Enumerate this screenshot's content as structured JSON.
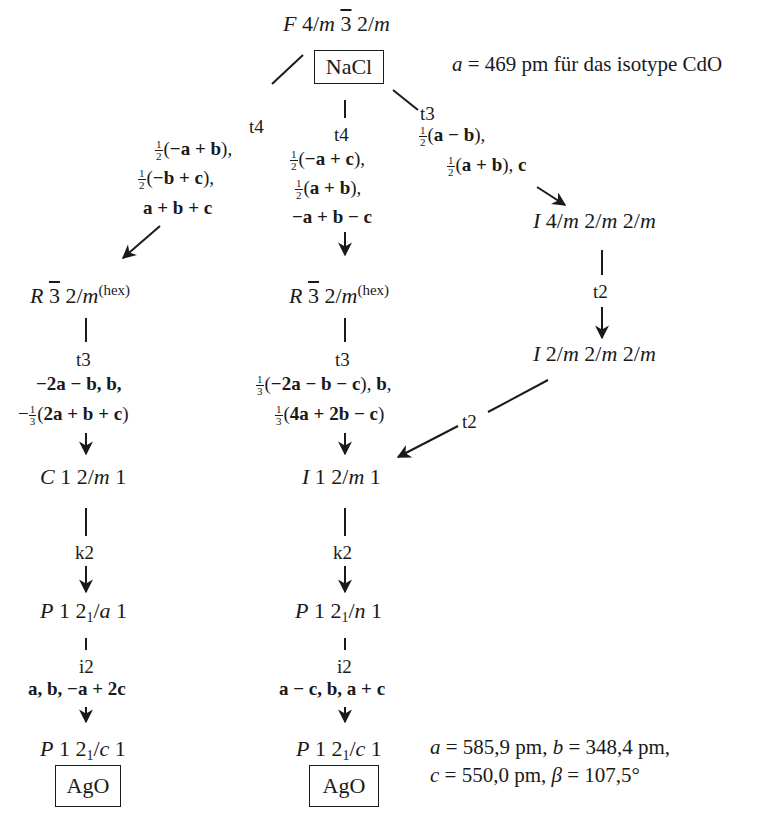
{
  "root": {
    "space_group": "F 4/m 3̄ 2/m",
    "compound": "NaCl",
    "parameter_note": "a = 469 pm für das isotype CdO"
  },
  "branches": {
    "left_t4": {
      "index": "t4",
      "transformation": [
        "½(−a + b),",
        "½(−b + c),",
        "a + b + c"
      ]
    },
    "middle_t4": {
      "index": "t4",
      "transformation": [
        "½(−a + c),",
        "½(a + b),",
        "−a + b − c"
      ]
    },
    "right_t3": {
      "index": "t3",
      "transformation": [
        "½(a − b),",
        "½(a + b), c"
      ]
    }
  },
  "left_column": {
    "g1": "R 3̄ 2/m (hex)",
    "t3": {
      "index": "t3",
      "transformation": [
        "−2a − b, b,",
        "−⅓(2a + b + c)"
      ]
    },
    "g2": "C 1 2/m 1",
    "k2": {
      "index": "k2"
    },
    "g3": "P 1 2₁/a 1",
    "i2": {
      "index": "i2",
      "transformation": [
        "a, b, −a + 2c"
      ]
    },
    "g4": "P 1 2₁/c 1",
    "compound": "AgO"
  },
  "middle_column": {
    "g1": "R 3̄ 2/m (hex)",
    "t3": {
      "index": "t3",
      "transformation": [
        "⅓(−2a − b − c), b,",
        "⅓(4a + 2b − c)"
      ]
    },
    "g2": "I 1 2/m 1",
    "k2": {
      "index": "k2"
    },
    "g3": "P 1 2₁/n 1",
    "i2": {
      "index": "i2",
      "transformation": [
        "a − c, b, a + c"
      ]
    },
    "g4": "P 1 2₁/c 1",
    "compound": "AgO"
  },
  "right_column": {
    "g1": "I 4/m 2/m 2/m",
    "t2": {
      "index": "t2"
    },
    "g2": "I 2/m 2/m 2/m",
    "t2_to_middle": {
      "index": "t2"
    }
  },
  "final_parameters": {
    "line1": "a = 585,9 pm, b = 348,4 pm,",
    "line2": "c = 550,0 pm, β = 107,5°"
  },
  "labels": {
    "hex": "(hex)",
    "frac_half_num": "1",
    "frac_half_den": "2",
    "frac_third_num": "1",
    "frac_third_den": "3"
  }
}
